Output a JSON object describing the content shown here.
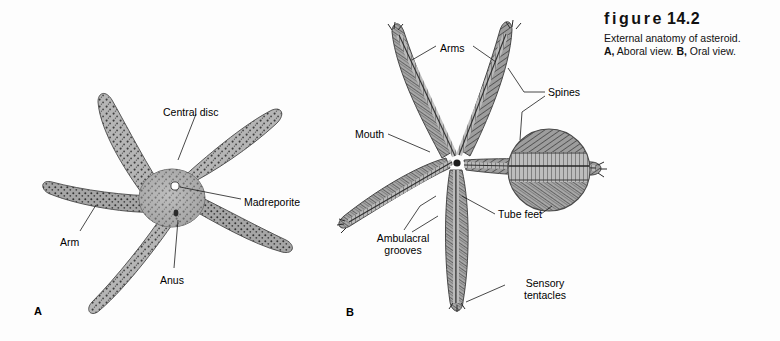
{
  "figure": {
    "title_word": "figure",
    "number": "14.2",
    "caption_line1": "External anatomy of asteroid.",
    "caption_line2_parts": [
      {
        "text": "A,",
        "bold": true
      },
      {
        "text": " Aboral view. ",
        "bold": false
      },
      {
        "text": "B,",
        "bold": true
      },
      {
        "text": " Oral view.",
        "bold": false
      }
    ],
    "caption_line2_plain": "A, Aboral view. B, Oral view."
  },
  "panels": [
    {
      "letter": "A",
      "view": "Aboral view",
      "letter_x": 34,
      "letter_y": 305,
      "labels": [
        {
          "name": "central-disc",
          "text": "Central disc",
          "x": 163,
          "y": 106
        },
        {
          "name": "madreporite",
          "text": "Madreporite",
          "x": 244,
          "y": 196
        },
        {
          "name": "arm",
          "text": "Arm",
          "x": 60,
          "y": 236
        },
        {
          "name": "anus",
          "text": "Anus",
          "x": 160,
          "y": 274
        }
      ]
    },
    {
      "letter": "B",
      "view": "Oral view",
      "letter_x": 346,
      "letter_y": 306,
      "labels": [
        {
          "name": "arms",
          "text": "Arms",
          "x": 440,
          "y": 42
        },
        {
          "name": "spines",
          "text": "Spines",
          "x": 548,
          "y": 90
        },
        {
          "name": "mouth",
          "text": "Mouth",
          "x": 355,
          "y": 131
        },
        {
          "name": "tube-feet",
          "text": "Tube feet",
          "x": 498,
          "y": 216
        },
        {
          "name": "ambulacral-grooves",
          "text": "Ambulacral grooves",
          "x": 366,
          "y": 236
        },
        {
          "name": "sensory-tentacles",
          "text": "Sensory tentacles",
          "x": 508,
          "y": 281
        }
      ]
    }
  ],
  "colors": {
    "background": "#fdfdfd",
    "ink": "#1a1a1a",
    "body_light": "#b9b9b9",
    "body_mid": "#9a9a9a",
    "body_dark": "#6e6e6e",
    "speckle": "#3a3a3a",
    "madreporite_dot": "#ffffff"
  }
}
